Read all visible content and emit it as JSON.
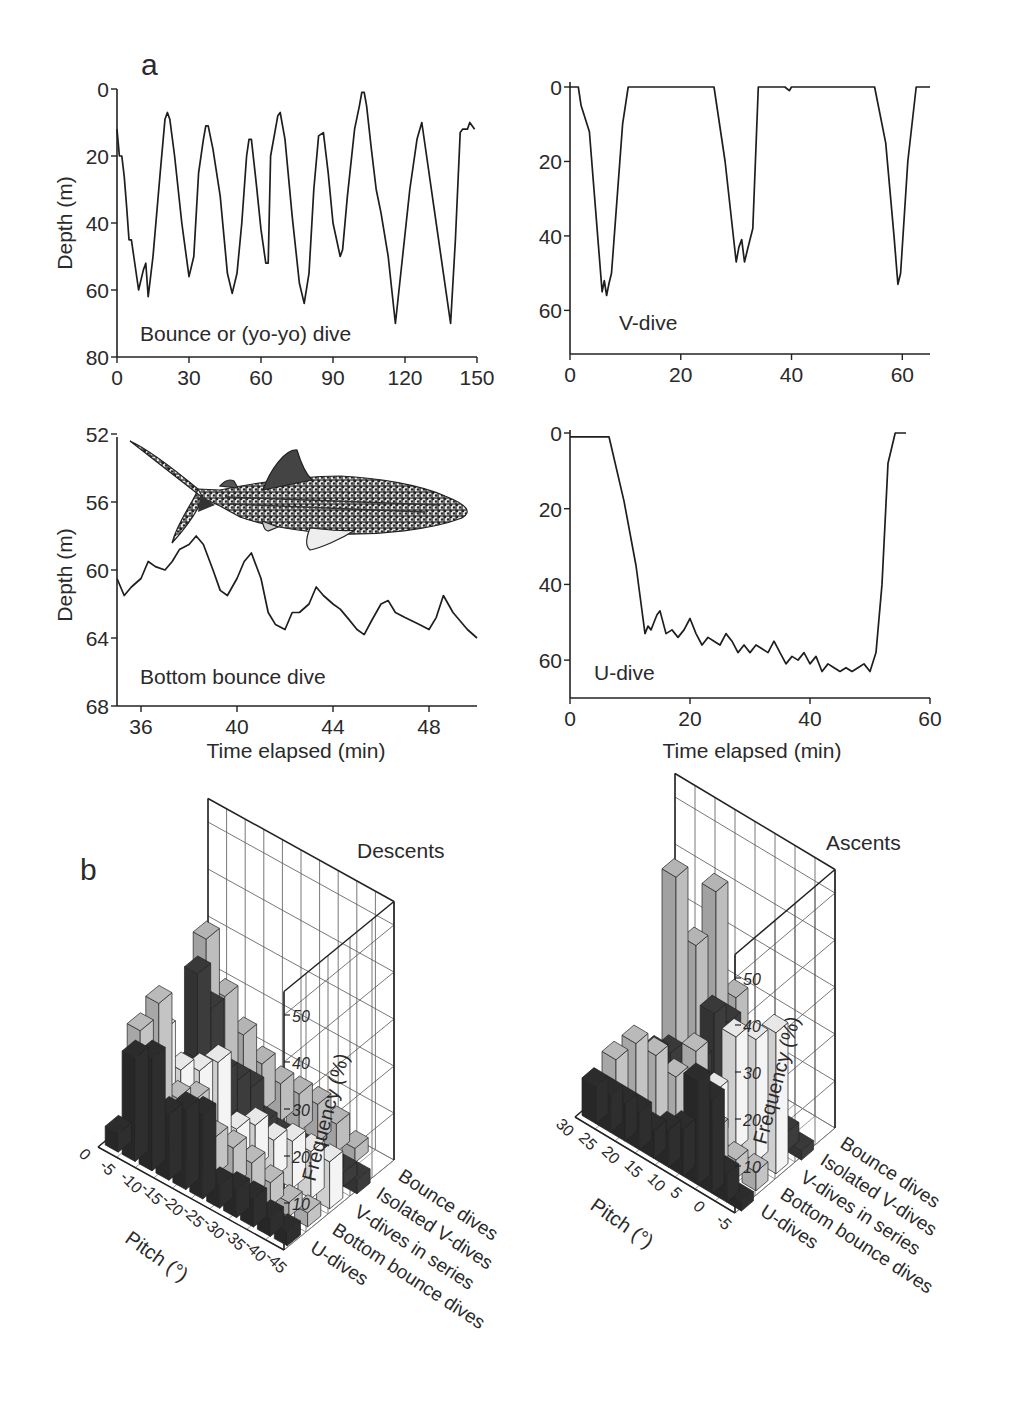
{
  "panel_labels": {
    "a": "a",
    "b": "b"
  },
  "chart_data": [
    {
      "id": "bounce",
      "type": "line",
      "annotation": "Bounce or (yo-yo) dive",
      "ylabel": "Depth (m)",
      "xlabel": "",
      "xticks": [
        "0",
        "30",
        "60",
        "90",
        "120",
        "150"
      ],
      "yticks": [
        "0",
        "20",
        "40",
        "60",
        "80"
      ],
      "xlim": [
        0,
        150
      ],
      "ylim": [
        0,
        80
      ],
      "y_inverted": true,
      "x": [
        0,
        1,
        2,
        3,
        4,
        5,
        6,
        7,
        9,
        11,
        12,
        13,
        15,
        18,
        20,
        21,
        22,
        24,
        27,
        30,
        32,
        34,
        36,
        37,
        38,
        40,
        43,
        46,
        48,
        50,
        52,
        54,
        55,
        56,
        58,
        60,
        62,
        63,
        64,
        67,
        68,
        70,
        73,
        76,
        78,
        80,
        82,
        84,
        86,
        88,
        90,
        93,
        94,
        96,
        99,
        101,
        102,
        103,
        104,
        106,
        108,
        110,
        113,
        116,
        119,
        122,
        125,
        127,
        129,
        132,
        136,
        139,
        141,
        143,
        144,
        146,
        147,
        149
      ],
      "y": [
        12,
        20,
        20,
        26,
        35,
        45,
        45,
        50,
        60,
        54,
        52,
        62,
        50,
        25,
        9,
        7,
        9,
        20,
        40,
        56,
        50,
        25,
        15,
        11,
        11,
        18,
        32,
        55,
        61,
        55,
        40,
        20,
        15,
        15,
        28,
        42,
        52,
        52,
        20,
        8,
        7,
        15,
        38,
        58,
        64,
        55,
        30,
        14,
        13,
        25,
        40,
        50,
        48,
        32,
        12,
        5,
        1,
        1,
        5,
        18,
        30,
        37,
        50,
        70,
        50,
        30,
        15,
        10,
        20,
        35,
        55,
        70,
        45,
        13,
        12,
        12,
        10,
        12
      ]
    },
    {
      "id": "v_dive",
      "type": "line",
      "annotation": "V-dive",
      "ylabel": "",
      "xlabel": "",
      "xticks": [
        "0",
        "20",
        "40",
        "60"
      ],
      "yticks": [
        "0",
        "20",
        "40",
        "60"
      ],
      "xlim": [
        0,
        65
      ],
      "ylim": [
        0,
        65
      ],
      "y_inverted": true,
      "x": [
        0,
        1.5,
        2,
        3.5,
        5.8,
        6.2,
        6.6,
        7,
        7.5,
        8,
        9.5,
        10.5,
        26,
        28,
        30,
        30.5,
        31,
        31.5,
        32,
        33,
        34,
        38.8,
        39.6,
        40,
        55,
        57,
        58.5,
        59.2,
        59.7,
        61,
        62.5,
        65
      ],
      "y": [
        0,
        0,
        5,
        12,
        55,
        52,
        56,
        53,
        50,
        40,
        10,
        0,
        0,
        20,
        47,
        43,
        41,
        47,
        44,
        38,
        0,
        0,
        1,
        0,
        0,
        15,
        40,
        53,
        50,
        20,
        0,
        0
      ]
    },
    {
      "id": "bottom_bounce",
      "type": "line",
      "annotation": "Bottom bounce dive",
      "ylabel": "Depth (m)",
      "xlabel": "Time elapsed (min)",
      "xticks": [
        "36",
        "40",
        "44",
        "48"
      ],
      "yticks": [
        "52",
        "56",
        "60",
        "64",
        "68"
      ],
      "xlim": [
        35,
        50
      ],
      "ylim": [
        50,
        68
      ],
      "y_inverted": true,
      "x": [
        35,
        35.3,
        35.6,
        36,
        36.3,
        36.6,
        37,
        37.3,
        37.6,
        38,
        38.3,
        38.6,
        39,
        39.3,
        39.6,
        40,
        40.3,
        40.6,
        41,
        41.3,
        41.6,
        42,
        42.3,
        42.6,
        43,
        43.3,
        43.6,
        44,
        44.3,
        44.6,
        45,
        45.3,
        45.6,
        46,
        46.3,
        46.6,
        47,
        47.3,
        47.6,
        48,
        48.3,
        48.6,
        49,
        49.3,
        49.6,
        50
      ],
      "y": [
        60.5,
        61.5,
        61,
        60.5,
        59.5,
        59.8,
        60,
        59.5,
        58.8,
        58.5,
        58,
        58.5,
        60,
        61.2,
        61.5,
        60.5,
        59.5,
        59,
        60.5,
        62.5,
        63.2,
        63.5,
        62.5,
        62.5,
        62,
        61,
        61.5,
        62,
        62.3,
        62.8,
        63.5,
        63.8,
        63,
        62,
        61.8,
        62.5,
        62.8,
        63,
        63.2,
        63.5,
        62.8,
        61.5,
        62.5,
        63,
        63.5,
        64
      ]
    },
    {
      "id": "u_dive",
      "type": "line",
      "annotation": "U-dive",
      "ylabel": "",
      "xlabel": "Time elapsed (min)",
      "xticks": [
        "0",
        "20",
        "40",
        "60"
      ],
      "yticks": [
        "0",
        "20",
        "40",
        "60"
      ],
      "xlim": [
        0,
        60
      ],
      "ylim": [
        0,
        70
      ],
      "y_inverted": true,
      "x": [
        0,
        6.5,
        9,
        11,
        12.5,
        13,
        13.5,
        14,
        14.5,
        15,
        16,
        17,
        18,
        19,
        20,
        21,
        22,
        23,
        24,
        25,
        26,
        27,
        28,
        29,
        30,
        31,
        32,
        33,
        34,
        35,
        36,
        37,
        38,
        39,
        40,
        41,
        42,
        43,
        44,
        45,
        46,
        47,
        48,
        49,
        50,
        51,
        52,
        53,
        54.2,
        56
      ],
      "y": [
        1,
        1,
        18,
        35,
        53,
        51,
        52,
        50,
        48,
        47,
        53,
        52,
        54,
        52,
        49,
        53,
        56,
        54,
        55,
        56,
        53,
        55,
        58,
        56,
        58,
        56,
        57,
        58,
        55,
        58,
        61,
        59,
        60,
        58,
        61,
        59,
        63,
        61,
        62,
        63,
        62,
        63,
        62,
        61,
        63,
        58,
        40,
        8,
        0,
        0
      ]
    },
    {
      "id": "descents",
      "type": "bar3d",
      "title": "Descents",
      "xlabel": "Pitch (°)",
      "zlabel": "Frequency (%)",
      "pitch_ticks": [
        "0",
        "-5",
        "-10",
        "-15",
        "-20",
        "-25",
        "-30",
        "-35",
        "-40",
        "-45"
      ],
      "freq_ticks": [
        "10",
        "20",
        "30",
        "40",
        "50"
      ],
      "categories": [
        "Bounce dives",
        "Isolated V-dives",
        "V-dives in series",
        "Bottom bounce dives",
        "U-dives"
      ],
      "series": [
        {
          "name": "U-dives",
          "color": "#2e2e2e",
          "values": [
            4,
            22,
            24,
            14,
            17,
            18,
            5,
            6,
            6,
            4,
            3
          ]
        },
        {
          "name": "Bottom bounce dives",
          "color": "#c4c4c4",
          "values": [
            22,
            30,
            12,
            14,
            8,
            8,
            7,
            5,
            3,
            3
          ]
        },
        {
          "name": "V-dives in series",
          "color": "#f4f4f4",
          "values": [
            18,
            12,
            14,
            18,
            6,
            9,
            8,
            10,
            10,
            10
          ]
        },
        {
          "name": "Isolated V-dives",
          "color": "#3c3c3c",
          "values": [
            6,
            28,
            22,
            10,
            10,
            10,
            4,
            3,
            3,
            3,
            3,
            3,
            3,
            3
          ]
        },
        {
          "name": "Bounce dives",
          "color": "#bdbdbd",
          "values": [
            30,
            20,
            14,
            10,
            8,
            8,
            8,
            6,
            3
          ]
        }
      ]
    },
    {
      "id": "ascents",
      "type": "bar3d",
      "title": "Ascents",
      "xlabel": "Pitch (°)",
      "zlabel": "Frequency (%)",
      "pitch_ticks": [
        "30",
        "25",
        "20",
        "15",
        "10",
        "5",
        "0",
        "-5"
      ],
      "freq_ticks": [
        "10",
        "20",
        "30",
        "40",
        "50"
      ],
      "categories": [
        "Bounce dives",
        "Isolated V-dives",
        "V-dives in series",
        "Bottom bounce dives",
        "U-dives"
      ],
      "series": [
        {
          "name": "U-dives",
          "color": "#2e2e2e",
          "values": [
            8,
            8,
            8,
            8,
            6,
            8,
            10,
            22,
            20,
            6,
            2
          ]
        },
        {
          "name": "Bottom bounce dives",
          "color": "#c4c4c4",
          "values": [
            10,
            16,
            16,
            14,
            22,
            8,
            4,
            4
          ]
        },
        {
          "name": "V-dives in series",
          "color": "#f4f4f4",
          "values": [
            4,
            5,
            5,
            6,
            10,
            24,
            26,
            30
          ]
        },
        {
          "name": "Isolated V-dives",
          "color": "#3c3c3c",
          "values": [
            4,
            6,
            6,
            8,
            20,
            20,
            8,
            6,
            5,
            4,
            2
          ]
        },
        {
          "name": "Bounce dives",
          "color": "#bdbdbd",
          "values": [
            38,
            26,
            40,
            20,
            6
          ]
        }
      ]
    }
  ]
}
